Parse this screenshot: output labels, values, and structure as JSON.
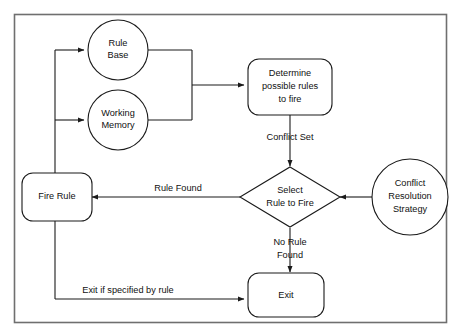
{
  "diagram": {
    "background_color": "#ffffff",
    "frame_color": "#6f6f6f",
    "stroke_color": "#1a1a1a",
    "nodes": {
      "rule_base": {
        "label_line1": "Rule",
        "label_line2": "Base",
        "shape": "circle"
      },
      "working_memory": {
        "label_line1": "Working",
        "label_line2": "Memory",
        "shape": "circle"
      },
      "determine": {
        "label_line1": "Determine",
        "label_line2": "possible rules",
        "label_line3": "to fire",
        "shape": "rounded-rect"
      },
      "select": {
        "label_line1": "Select",
        "label_line2": "Rule to Fire",
        "shape": "diamond"
      },
      "conflict_strategy": {
        "label_line1": "Conflict",
        "label_line2": "Resolution",
        "label_line3": "Strategy",
        "shape": "circle"
      },
      "fire_rule": {
        "label_line1": "Fire Rule",
        "shape": "rounded-rect"
      },
      "exit": {
        "label_line1": "Exit",
        "shape": "rounded-rect"
      }
    },
    "edge_labels": {
      "conflict_set": "Conflict Set",
      "rule_found": "Rule Found",
      "no_rule_found_line1": "No Rule",
      "no_rule_found_line2": "Found",
      "exit_if_specified": "Exit if specified by rule"
    }
  }
}
